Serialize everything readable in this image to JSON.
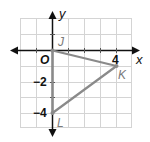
{
  "diagram": {
    "type": "coordinate-plane",
    "axes": {
      "x_label": "x",
      "y_label": "y",
      "origin_label": "O"
    },
    "grid": {
      "x_min": -2,
      "x_max": 5,
      "y_min": -5,
      "y_max": 2,
      "step": 1
    },
    "tick_labels": {
      "x": [
        "4"
      ],
      "y": [
        "-2",
        "-4"
      ]
    },
    "points": [
      {
        "name": "J",
        "x": 0,
        "y": 0
      },
      {
        "name": "K",
        "x": 4,
        "y": -1
      },
      {
        "name": "L",
        "x": 0,
        "y": -4
      }
    ],
    "polygon": [
      "J",
      "K",
      "L"
    ],
    "colors": {
      "grid": "#d4d4d4",
      "axis": "#111111",
      "shape": "#8a8a8a",
      "point_label": "#7a7a7a"
    }
  }
}
